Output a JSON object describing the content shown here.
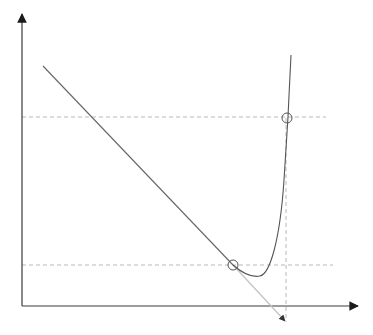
{
  "diagram": {
    "title": "",
    "colors": {
      "axis": "#2b2b2b",
      "curve": "#555555",
      "tangent_line": "#666666",
      "tangent_extension": "#bdbdbd",
      "guide_dashed": "#b0b0b0",
      "marker": "#555555",
      "background": "#ffffff"
    },
    "elements": {
      "x_axis": {
        "label": "",
        "has_arrow": true
      },
      "y_axis": {
        "label": "",
        "has_arrow": true
      },
      "curve": {
        "shape": "U-shaped with steep right rise",
        "label": ""
      },
      "tangent_line": {
        "label": "",
        "extends_past_lower_point": true,
        "ends_with_arrow": true
      },
      "points": [
        {
          "name": "lower-intersection",
          "label": ""
        },
        {
          "name": "upper-intersection",
          "label": ""
        }
      ],
      "guides": [
        {
          "name": "upper-horizontal-guide",
          "style": "dashed"
        },
        {
          "name": "lower-horizontal-guide",
          "style": "dashed"
        },
        {
          "name": "vertical-guide",
          "style": "dashed"
        }
      ]
    }
  }
}
